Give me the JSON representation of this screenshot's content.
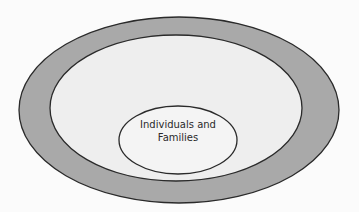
{
  "diagram": {
    "type": "nested-ellipses",
    "rings": [
      {
        "name": "outer-ring",
        "fill": "#a9a9a9",
        "stroke": "#2a2a2a",
        "label": ""
      },
      {
        "name": "middle-ring",
        "fill": "#eeeeee",
        "stroke": "#2a2a2a",
        "label": ""
      },
      {
        "name": "inner-ellipse",
        "fill": "#f5f5f5",
        "stroke": "#2a2a2a",
        "label": "Individuals and Families"
      }
    ],
    "inner_label_line1": "Individuals and",
    "inner_label_line2": "Families"
  }
}
